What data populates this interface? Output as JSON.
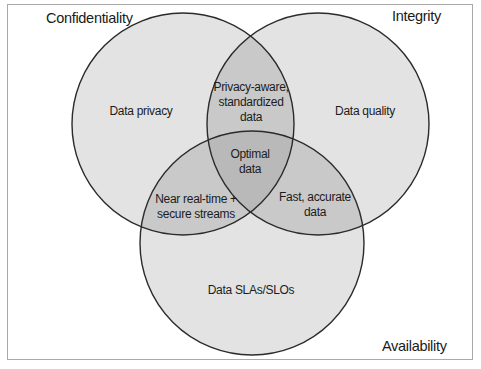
{
  "diagram": {
    "type": "venn",
    "sets": [
      {
        "id": "confidentiality",
        "title": "Confidentiality",
        "region_label": "Data privacy"
      },
      {
        "id": "integrity",
        "title": "Integrity",
        "region_label": "Data quality"
      },
      {
        "id": "availability",
        "title": "Availability",
        "region_label": "Data SLAs/SLOs"
      }
    ],
    "intersections": {
      "confidentiality_integrity": "Privacy-aware,\nstandardized\ndata",
      "confidentiality_availability": "Near real-time +\nsecure streams",
      "integrity_availability": "Fast, accurate\ndata",
      "all": "Optimal\ndata"
    },
    "colors": {
      "single_fill": "#e3e3e3",
      "double_fill": "#c9c9c9",
      "triple_fill": "#b9b9b9",
      "stroke": "#2b2b2b",
      "frame": "#a9a9a9"
    }
  }
}
